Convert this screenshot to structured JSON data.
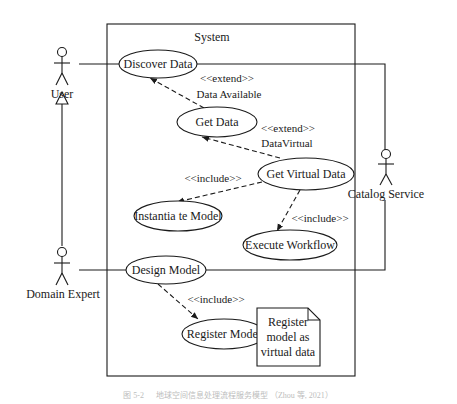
{
  "diagram": {
    "type": "uml-use-case",
    "system": {
      "label": "System"
    },
    "actors": [
      {
        "id": "user",
        "label": "User"
      },
      {
        "id": "domain_expert",
        "label": "Domain Expert"
      },
      {
        "id": "catalog_service",
        "label": "Catalog Service"
      }
    ],
    "use_cases": [
      {
        "id": "discover_data",
        "label": "Discover Data"
      },
      {
        "id": "get_data",
        "label": "Get Data"
      },
      {
        "id": "get_virtual_data",
        "label": "Get Virtual Data"
      },
      {
        "id": "instantiate_model",
        "label": "Instantia te Model"
      },
      {
        "id": "execute_workflow",
        "label": "Execute Workflow"
      },
      {
        "id": "design_model",
        "label": "Design Model"
      },
      {
        "id": "register_model",
        "label": "Register Model"
      }
    ],
    "relations": [
      {
        "from": "get_data",
        "to": "discover_data",
        "stereotype": "<<extend>>",
        "condition": "Data Available"
      },
      {
        "from": "get_virtual_data",
        "to": "get_data",
        "stereotype": "<<extend>>",
        "condition": "DataVirtual"
      },
      {
        "from": "get_virtual_data",
        "to": "instantiate_model",
        "stereotype": "<<include>>"
      },
      {
        "from": "get_virtual_data",
        "to": "execute_workflow",
        "stereotype": "<<include>>"
      },
      {
        "from": "design_model",
        "to": "register_model",
        "stereotype": "<<include>>"
      },
      {
        "from": "domain_expert",
        "to": "user",
        "type": "generalization"
      },
      {
        "from": "user",
        "to": "discover_data",
        "type": "association"
      },
      {
        "from": "domain_expert",
        "to": "design_model",
        "type": "association"
      },
      {
        "from": "catalog_service",
        "to": "discover_data",
        "type": "association"
      },
      {
        "from": "catalog_service",
        "to": "design_model",
        "type": "association"
      }
    ],
    "note": {
      "lines": [
        "Register",
        "model as",
        "virtual data"
      ]
    },
    "caption": "图 5-2 　 地球空间信息处理流程服务模型 （Zhou 等, 2021）"
  }
}
